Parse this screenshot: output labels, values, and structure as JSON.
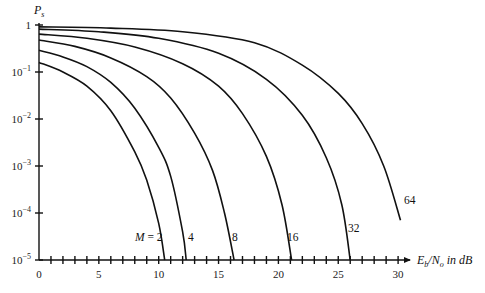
{
  "chart_data": {
    "type": "line",
    "title": "",
    "xlabel": "E_b/N_o in dB",
    "ylabel": "P_s",
    "xscale": "linear",
    "yscale": "log",
    "xlim": [
      0,
      30
    ],
    "ylim": [
      1e-05,
      1
    ],
    "x_ticks": [
      0,
      5,
      10,
      15,
      20,
      25,
      30
    ],
    "x_minor_tick_step": 1,
    "y_ticks": [
      1,
      0.1,
      0.01,
      0.001,
      0.0001,
      1e-05
    ],
    "y_tick_labels": [
      "1",
      "10^-1",
      "10^-2",
      "10^-3",
      "10^-4",
      "10^-5"
    ],
    "grid": false,
    "legend": "inline curve labels",
    "series": [
      {
        "name": "M = 2",
        "label": "M = 2",
        "x": [
          0,
          2,
          4,
          6,
          8,
          9,
          10,
          10.5
        ],
        "y": [
          0.16,
          0.1,
          0.05,
          0.015,
          0.002,
          0.0005,
          6e-05,
          1e-05
        ]
      },
      {
        "name": "4",
        "label": "4",
        "x": [
          0,
          2,
          4,
          6,
          8,
          10,
          11,
          12,
          12.3
        ],
        "y": [
          0.29,
          0.21,
          0.13,
          0.06,
          0.017,
          0.0025,
          0.0006,
          4e-05,
          1e-05
        ]
      },
      {
        "name": "8",
        "label": "8",
        "x": [
          0,
          3,
          6,
          9,
          11,
          13,
          14.5,
          15.5,
          16.3
        ],
        "y": [
          0.48,
          0.35,
          0.2,
          0.08,
          0.028,
          0.005,
          0.0008,
          0.0001,
          1e-05
        ]
      },
      {
        "name": "16",
        "label": "16",
        "x": [
          0,
          4,
          8,
          12,
          15,
          17,
          19,
          20.3,
          21.1
        ],
        "y": [
          0.64,
          0.52,
          0.34,
          0.15,
          0.05,
          0.013,
          0.0016,
          0.00015,
          1e-05
        ]
      },
      {
        "name": "32",
        "label": "32",
        "x": [
          0,
          5,
          10,
          15,
          19,
          22,
          24,
          25.3,
          26
        ],
        "y": [
          0.82,
          0.72,
          0.52,
          0.25,
          0.07,
          0.012,
          0.0015,
          0.00015,
          1e-05
        ]
      },
      {
        "name": "64",
        "label": "64",
        "x": [
          0,
          6,
          12,
          18,
          22,
          25,
          27,
          28.8,
          30.2
        ],
        "y": [
          0.91,
          0.86,
          0.72,
          0.42,
          0.14,
          0.035,
          0.008,
          0.001,
          7e-05
        ]
      }
    ]
  },
  "axes": {
    "y_title": "P",
    "y_title_sub": "s",
    "x_title_parts": [
      "E",
      "b",
      "/N",
      "o",
      " in dB"
    ],
    "y_tick_labels": [
      {
        "base": "1",
        "exp": ""
      },
      {
        "base": "10",
        "exp": "−1"
      },
      {
        "base": "10",
        "exp": "−2"
      },
      {
        "base": "10",
        "exp": "−3"
      },
      {
        "base": "10",
        "exp": "−4"
      },
      {
        "base": "10",
        "exp": "−5"
      }
    ],
    "x_tick_labels": [
      "0",
      "5",
      "10",
      "15",
      "20",
      "25",
      "30"
    ]
  },
  "curve_labels": [
    "M = 2",
    "4",
    "8",
    "16",
    "32",
    "64"
  ]
}
